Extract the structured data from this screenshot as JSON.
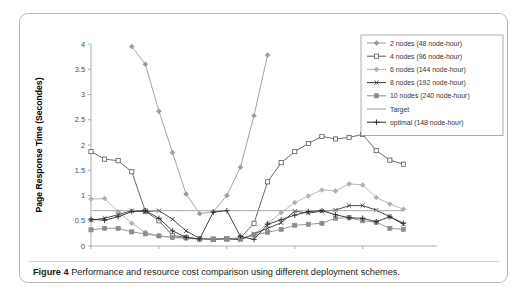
{
  "figure": {
    "caption_label": "Figure 4",
    "caption_text": "Performance and resource cost comparison using different deployment schemes."
  },
  "chart_data": {
    "type": "line",
    "title": "",
    "xlabel": "Hours",
    "ylabel": "Page Response Time (Secondes)",
    "xlim": [
      0,
      24
    ],
    "ylim": [
      0,
      4
    ],
    "xticks": [
      0,
      5,
      10,
      15,
      20
    ],
    "yticks": [
      0,
      0.5,
      1,
      1.5,
      2,
      2.5,
      3,
      3.5,
      4
    ],
    "xtick_labels": [
      "0",
      "5",
      "10",
      "15",
      "20"
    ],
    "ytick_labels": [
      "0",
      "0.5",
      "1",
      "1.5",
      "2",
      "2.5",
      "3",
      "3.5",
      "4"
    ],
    "grid": false,
    "legend_position": "top-right",
    "x": [
      0,
      1,
      2,
      3,
      4,
      5,
      6,
      7,
      8,
      9,
      10,
      11,
      12,
      13,
      14,
      15,
      16,
      17,
      18,
      19,
      20,
      21,
      22,
      23
    ],
    "series": [
      {
        "name": "2 nodes (48 node-hour)",
        "color": "#9a9a9a",
        "marker": "diamond",
        "values": [
          null,
          null,
          null,
          3.95,
          3.6,
          2.67,
          1.85,
          1.03,
          0.64,
          0.68,
          1.0,
          1.56,
          2.58,
          3.78,
          null,
          null,
          null,
          null,
          null,
          null,
          null,
          null,
          null,
          null
        ]
      },
      {
        "name": "4 nodes (96 node-hour)",
        "color": "#5a5a5a",
        "marker": "square-open",
        "values": [
          1.87,
          1.72,
          1.69,
          1.47,
          0.69,
          0.5,
          0.21,
          0.17,
          0.14,
          0.13,
          0.14,
          0.16,
          0.45,
          1.27,
          1.65,
          1.87,
          2.03,
          2.17,
          2.12,
          2.15,
          2.21,
          1.89,
          1.7,
          1.62
        ]
      },
      {
        "name": "6 nodes (144 node-hour)",
        "color": "#b0b0b0",
        "marker": "diamond",
        "values": [
          0.93,
          0.94,
          0.68,
          0.45,
          0.27,
          0.2,
          0.17,
          0.15,
          0.13,
          0.13,
          0.13,
          0.13,
          0.23,
          0.45,
          0.66,
          0.86,
          0.99,
          1.11,
          1.09,
          1.23,
          1.21,
          0.96,
          0.83,
          0.73
        ]
      },
      {
        "name": "8 nodes (192 node-hour)",
        "color": "#3a3a3a",
        "marker": "cross",
        "values": [
          0.51,
          0.55,
          0.62,
          0.7,
          0.68,
          0.7,
          0.53,
          0.3,
          0.15,
          0.13,
          0.15,
          0.12,
          0.24,
          0.35,
          0.46,
          0.69,
          0.65,
          0.69,
          0.71,
          0.8,
          0.8,
          0.71,
          0.58,
          0.43
        ]
      },
      {
        "name": "10 nodes (240 node-hour)",
        "color": "#8c8c8c",
        "marker": "square-filled",
        "values": [
          0.32,
          0.35,
          0.35,
          0.28,
          0.24,
          0.2,
          0.17,
          0.16,
          0.14,
          0.14,
          0.14,
          0.15,
          0.22,
          0.27,
          0.33,
          0.41,
          0.43,
          0.45,
          0.55,
          0.56,
          0.5,
          0.47,
          0.35,
          0.33
        ]
      },
      {
        "name": "Target",
        "color": "#9f9f9f",
        "marker": "none",
        "values": [
          0.7,
          0.7,
          0.7,
          0.7,
          0.7,
          0.7,
          0.7,
          0.7,
          0.7,
          0.7,
          0.7,
          0.7,
          0.7,
          0.7,
          0.7,
          0.7,
          0.7,
          0.7,
          0.7,
          0.7,
          0.7,
          0.7,
          0.7,
          0.7
        ]
      },
      {
        "name": "optimal (148 node-hour)",
        "color": "#2d2d2d",
        "marker": "plus",
        "values": [
          0.53,
          0.51,
          0.58,
          0.68,
          0.7,
          0.55,
          0.3,
          0.17,
          0.14,
          0.67,
          0.7,
          0.19,
          0.13,
          0.43,
          0.52,
          0.61,
          0.68,
          0.7,
          0.62,
          0.56,
          0.55,
          0.48,
          0.58,
          0.45
        ]
      }
    ]
  }
}
